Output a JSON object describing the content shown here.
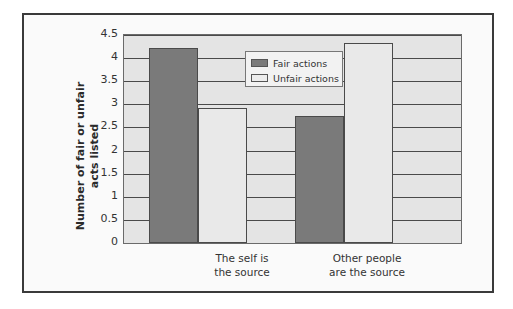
{
  "chart_data": {
    "type": "bar",
    "title": "",
    "xlabel": "",
    "ylabel": "Number of fair or unfair acts listed",
    "ylabel_lines": [
      "Number of fair or unfair",
      "acts listed"
    ],
    "categories": [
      "The self is the source",
      "Other people are the source"
    ],
    "category_lines": [
      [
        "The self is",
        "the source"
      ],
      [
        "Other people",
        "are the source"
      ]
    ],
    "series": [
      {
        "name": "Fair actions",
        "values": [
          4.22,
          2.75
        ],
        "color": "#7a7a7a"
      },
      {
        "name": "Unfair actions",
        "values": [
          2.92,
          4.32
        ],
        "color": "#e9e9e9"
      }
    ],
    "ylim": [
      0,
      4.5
    ],
    "yticks": [
      "0",
      "0.5",
      "1",
      "1.5",
      "2",
      "2.5",
      "3",
      "3.5",
      "4",
      "4.5"
    ],
    "grid": true,
    "legend_position": "upper center"
  }
}
